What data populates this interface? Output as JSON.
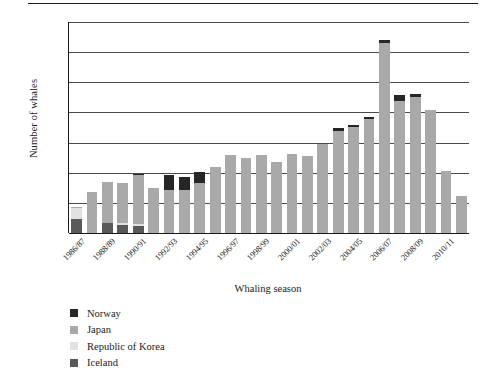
{
  "chart_data": {
    "type": "bar",
    "subtype": "stacked-vertical",
    "title": "",
    "xlabel": "Whaling season",
    "ylabel": "Number of whales",
    "ylim": [
      0,
      1400
    ],
    "ytick_step": 200,
    "yticks": [
      "1,400",
      "1,200",
      "1,000",
      "800",
      "600",
      "400",
      "200",
      "0"
    ],
    "ytick_values": [
      1400,
      1200,
      1000,
      800,
      600,
      400,
      200,
      0
    ],
    "grid": true,
    "grid_axis": "y",
    "legend_position": "below-left",
    "stack_order_bottom_to_top": [
      "Iceland",
      "Republic of Korea",
      "Japan",
      "Norway"
    ],
    "categories": [
      "1986/87",
      "1987/88",
      "1988/89",
      "1989/90",
      "1990/91",
      "1991/92",
      "1992/93",
      "1993/94",
      "1994/95",
      "1995/96",
      "1996/97",
      "1997/98",
      "1998/99",
      "1999/00",
      "2000/01",
      "2001/02",
      "2002/03",
      "2003/04",
      "2004/05",
      "2005/06",
      "2006/07",
      "2007/08",
      "2008/09",
      "2009/10",
      "2010/11",
      "2011/12"
    ],
    "tick_labels_shown": [
      "1986/87",
      "1988/89",
      "1990/91",
      "1992/93",
      "1994/95",
      "1996/97",
      "1998/99",
      "2000/01",
      "2002/03",
      "2004/05",
      "2006/07",
      "2008/09",
      "2010/11"
    ],
    "series": [
      {
        "name": "Iceland",
        "color": "#595959",
        "values": [
          92,
          0,
          68,
          55,
          48,
          0,
          0,
          0,
          0,
          0,
          0,
          0,
          0,
          0,
          0,
          0,
          0,
          0,
          0,
          0,
          0,
          0,
          0,
          0,
          0,
          0
        ]
      },
      {
        "name": "Republic of Korea",
        "color": "#e2e2e2",
        "values": [
          76,
          0,
          0,
          10,
          12,
          0,
          0,
          0,
          0,
          0,
          0,
          0,
          0,
          0,
          0,
          0,
          0,
          0,
          0,
          0,
          0,
          0,
          0,
          0,
          0,
          0
        ]
      },
      {
        "name": "Japan",
        "color": "#a9a9a9",
        "values": [
          5,
          273,
          273,
          265,
          327,
          300,
          288,
          288,
          330,
          440,
          520,
          500,
          520,
          473,
          524,
          513,
          590,
          674,
          705,
          754,
          1262,
          875,
          900,
          813,
          409,
          243
        ]
      },
      {
        "name": "Norway",
        "color": "#262626",
        "values": [
          0,
          0,
          0,
          0,
          5,
          0,
          100,
          83,
          74,
          0,
          0,
          0,
          0,
          0,
          0,
          0,
          0,
          21,
          11,
          18,
          21,
          39,
          20,
          0,
          0,
          0
        ]
      }
    ],
    "totals": [
      173,
      273,
      341,
      330,
      392,
      300,
      388,
      371,
      404,
      440,
      520,
      500,
      520,
      473,
      524,
      513,
      590,
      695,
      716,
      772,
      1283,
      914,
      920,
      813,
      409,
      243
    ],
    "peak": {
      "category": "2006/07",
      "value": 1283
    }
  },
  "legend": {
    "items": [
      {
        "label": "Norway",
        "color": "#262626"
      },
      {
        "label": "Japan",
        "color": "#a9a9a9"
      },
      {
        "label": "Republic of Korea",
        "color": "#e2e2e2"
      },
      {
        "label": "Iceland",
        "color": "#595959"
      }
    ]
  }
}
